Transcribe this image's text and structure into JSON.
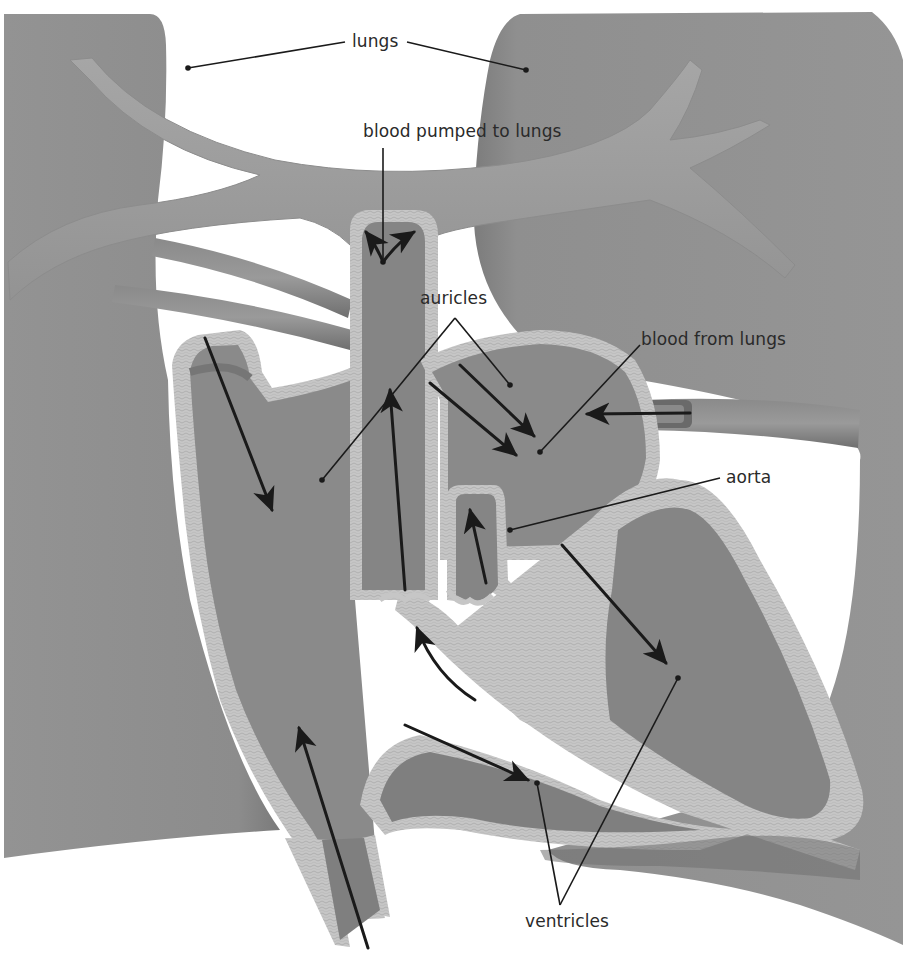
{
  "diagram": {
    "palette": {
      "background": "#ffffff",
      "lung": "#8f8f8f",
      "lung_shadow": "#7a7a7a",
      "vessel": "#9c9c9c",
      "vessel_dark": "#6e6e6e",
      "chamber": "#8a8a8a",
      "chamber_dark": "#747474",
      "wall": "#c4c4c4",
      "wall_edge": "#a8a8a8",
      "ink": "#1a1a1a"
    },
    "labels": {
      "lungs": "lungs",
      "blood_pumped_to_lungs": "blood pumped to lungs",
      "auricles": "auricles",
      "blood_from_lungs": "blood from lungs",
      "aorta": "aorta",
      "ventricles": "ventricles"
    },
    "label_positions": {
      "lungs": {
        "x": 352,
        "y": 34
      },
      "blood_pumped_to_lungs": {
        "x": 363,
        "y": 124
      },
      "auricles": {
        "x": 420,
        "y": 290
      },
      "blood_from_lungs": {
        "x": 641,
        "y": 332
      },
      "aorta": {
        "x": 726,
        "y": 470
      },
      "ventricles": {
        "x": 525,
        "y": 912
      }
    },
    "leader_lines": [
      {
        "label": "lungs",
        "from": [
          345,
          42
        ],
        "to": [
          188,
          68
        ],
        "target": "left lung"
      },
      {
        "label": "lungs",
        "from": [
          407,
          42
        ],
        "to": [
          526,
          70
        ],
        "target": "right lung"
      },
      {
        "label": "blood_pumped_to_lungs",
        "from": [
          383,
          148
        ],
        "to": [
          383,
          262
        ],
        "target": "pulmonary artery"
      },
      {
        "label": "auricles",
        "from": [
          455,
          318
        ],
        "to": [
          322,
          480
        ],
        "target": "right auricle"
      },
      {
        "label": "auricles",
        "from": [
          455,
          318
        ],
        "to": [
          510,
          385
        ],
        "target": "left auricle"
      },
      {
        "label": "blood_from_lungs",
        "from": [
          640,
          345
        ],
        "to": [
          540,
          452
        ],
        "target": "left auricle"
      },
      {
        "label": "aorta",
        "from": [
          720,
          478
        ],
        "to": [
          510,
          530
        ],
        "target": "aorta"
      },
      {
        "label": "ventricles",
        "from": [
          560,
          905
        ],
        "to": [
          537,
          783
        ],
        "target": "right ventricle"
      },
      {
        "label": "ventricles",
        "from": [
          560,
          905
        ],
        "to": [
          678,
          678
        ],
        "target": "left ventricle"
      }
    ],
    "flow_arrows": [
      {
        "name": "arrow-pulmonary-split-left",
        "from": [
          383,
          262
        ],
        "to": [
          366,
          232
        ]
      },
      {
        "name": "arrow-pulmonary-split-right",
        "from": [
          383,
          262
        ],
        "to": [
          414,
          232
        ]
      },
      {
        "name": "arrow-pulmonary-up",
        "from": [
          405,
          590
        ],
        "to": [
          390,
          390
        ]
      },
      {
        "name": "arrow-vena-cava-down",
        "from": [
          205,
          338
        ],
        "to": [
          272,
          510
        ]
      },
      {
        "name": "arrow-vena-cava-up",
        "from": [
          368,
          948
        ],
        "to": [
          299,
          728
        ]
      },
      {
        "name": "arrow-pulmonary-vein-upper",
        "from": [
          460,
          365
        ],
        "to": [
          534,
          436
        ]
      },
      {
        "name": "arrow-pulmonary-vein-lower",
        "from": [
          430,
          383
        ],
        "to": [
          516,
          455
        ]
      },
      {
        "name": "arrow-from-lungs-left",
        "from": [
          690,
          413
        ],
        "to": [
          587,
          414
        ]
      },
      {
        "name": "arrow-aorta-up",
        "from": [
          486,
          583
        ],
        "to": [
          470,
          510
        ]
      },
      {
        "name": "arrow-ventricle-right-to-artery",
        "from": [
          475,
          700
        ],
        "to": [
          417,
          628
        ]
      },
      {
        "name": "arrow-into-right-ventricle",
        "from": [
          405,
          725
        ],
        "to": [
          528,
          780
        ]
      },
      {
        "name": "arrow-into-left-ventricle",
        "from": [
          562,
          545
        ],
        "to": [
          666,
          663
        ]
      }
    ]
  }
}
